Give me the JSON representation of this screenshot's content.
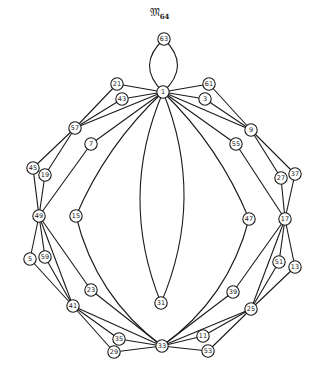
{
  "title": {
    "main": "𝔐",
    "subscript": "64"
  },
  "colors": {
    "stroke": "#1a1a1a",
    "background": "#ffffff"
  },
  "nodes": [
    {
      "id": "63",
      "x": 164,
      "y": 39
    },
    {
      "id": "1",
      "x": 163,
      "y": 92
    },
    {
      "id": "21",
      "x": 117,
      "y": 84
    },
    {
      "id": "43",
      "x": 122,
      "y": 99
    },
    {
      "id": "61",
      "x": 209,
      "y": 84
    },
    {
      "id": "3",
      "x": 205,
      "y": 99
    },
    {
      "id": "57",
      "x": 75,
      "y": 128
    },
    {
      "id": "9",
      "x": 251,
      "y": 130
    },
    {
      "id": "7",
      "x": 91,
      "y": 144
    },
    {
      "id": "55",
      "x": 236,
      "y": 144
    },
    {
      "id": "45",
      "x": 33,
      "y": 168
    },
    {
      "id": "19",
      "x": 45,
      "y": 175
    },
    {
      "id": "27",
      "x": 281,
      "y": 178
    },
    {
      "id": "37",
      "x": 295,
      "y": 174
    },
    {
      "id": "49",
      "x": 39,
      "y": 216
    },
    {
      "id": "15",
      "x": 76,
      "y": 216
    },
    {
      "id": "47",
      "x": 249,
      "y": 219
    },
    {
      "id": "17",
      "x": 285,
      "y": 219
    },
    {
      "id": "5",
      "x": 30,
      "y": 259
    },
    {
      "id": "59",
      "x": 45,
      "y": 257
    },
    {
      "id": "51",
      "x": 279,
      "y": 262
    },
    {
      "id": "13",
      "x": 295,
      "y": 267
    },
    {
      "id": "23",
      "x": 91,
      "y": 290
    },
    {
      "id": "39",
      "x": 233,
      "y": 292
    },
    {
      "id": "41",
      "x": 73,
      "y": 306
    },
    {
      "id": "25",
      "x": 251,
      "y": 309
    },
    {
      "id": "31",
      "x": 161,
      "y": 303
    },
    {
      "id": "35",
      "x": 119,
      "y": 339
    },
    {
      "id": "11",
      "x": 203,
      "y": 336
    },
    {
      "id": "29",
      "x": 114,
      "y": 352
    },
    {
      "id": "53",
      "x": 208,
      "y": 351
    },
    {
      "id": "33",
      "x": 162,
      "y": 346
    }
  ],
  "edges": [
    {
      "from": "63",
      "to": "1",
      "curve": -14
    },
    {
      "from": "63",
      "to": "1",
      "curve": 14
    },
    {
      "from": "1",
      "to": "21",
      "curve": 0
    },
    {
      "from": "1",
      "to": "43",
      "curve": 0
    },
    {
      "from": "1",
      "to": "61",
      "curve": 0
    },
    {
      "from": "1",
      "to": "3",
      "curve": 0
    },
    {
      "from": "1",
      "to": "7",
      "curve": 0
    },
    {
      "from": "1",
      "to": "55",
      "curve": 0
    },
    {
      "from": "1",
      "to": "57",
      "curve": 0
    },
    {
      "from": "1",
      "to": "9",
      "curve": 0
    },
    {
      "from": "21",
      "to": "57",
      "curve": 0
    },
    {
      "from": "43",
      "to": "57",
      "curve": 0
    },
    {
      "from": "61",
      "to": "9",
      "curve": 0
    },
    {
      "from": "3",
      "to": "9",
      "curve": 0
    },
    {
      "from": "57",
      "to": "45",
      "curve": 0
    },
    {
      "from": "57",
      "to": "19",
      "curve": 0
    },
    {
      "from": "9",
      "to": "27",
      "curve": 0
    },
    {
      "from": "9",
      "to": "37",
      "curve": 0
    },
    {
      "from": "45",
      "to": "49",
      "curve": 0
    },
    {
      "from": "19",
      "to": "49",
      "curve": 0
    },
    {
      "from": "27",
      "to": "17",
      "curve": 0
    },
    {
      "from": "37",
      "to": "17",
      "curve": 0
    },
    {
      "from": "7",
      "to": "49",
      "curve": 0
    },
    {
      "from": "55",
      "to": "17",
      "curve": 0
    },
    {
      "from": "1",
      "to": "15",
      "curve": 8
    },
    {
      "from": "15",
      "to": "33",
      "curve": 14
    },
    {
      "from": "1",
      "to": "47",
      "curve": -8
    },
    {
      "from": "47",
      "to": "33",
      "curve": -14
    },
    {
      "from": "1",
      "to": "31",
      "curve": 22
    },
    {
      "from": "1",
      "to": "31",
      "curve": -22
    },
    {
      "from": "49",
      "to": "5",
      "curve": 0
    },
    {
      "from": "49",
      "to": "59",
      "curve": 0
    },
    {
      "from": "49",
      "to": "23",
      "curve": 0
    },
    {
      "from": "49",
      "to": "41",
      "curve": 0
    },
    {
      "from": "17",
      "to": "51",
      "curve": 0
    },
    {
      "from": "17",
      "to": "13",
      "curve": 0
    },
    {
      "from": "17",
      "to": "39",
      "curve": 0
    },
    {
      "from": "17",
      "to": "25",
      "curve": 0
    },
    {
      "from": "5",
      "to": "41",
      "curve": 0
    },
    {
      "from": "59",
      "to": "41",
      "curve": 0
    },
    {
      "from": "51",
      "to": "25",
      "curve": 0
    },
    {
      "from": "13",
      "to": "25",
      "curve": 0
    },
    {
      "from": "23",
      "to": "33",
      "curve": 0
    },
    {
      "from": "39",
      "to": "33",
      "curve": 0
    },
    {
      "from": "41",
      "to": "35",
      "curve": 0
    },
    {
      "from": "41",
      "to": "29",
      "curve": 0
    },
    {
      "from": "41",
      "to": "33",
      "curve": 0
    },
    {
      "from": "25",
      "to": "11",
      "curve": 0
    },
    {
      "from": "25",
      "to": "53",
      "curve": 0
    },
    {
      "from": "25",
      "to": "33",
      "curve": 0
    },
    {
      "from": "35",
      "to": "33",
      "curve": 0
    },
    {
      "from": "29",
      "to": "33",
      "curve": 0
    },
    {
      "from": "11",
      "to": "33",
      "curve": 0
    },
    {
      "from": "53",
      "to": "33",
      "curve": 0
    }
  ]
}
